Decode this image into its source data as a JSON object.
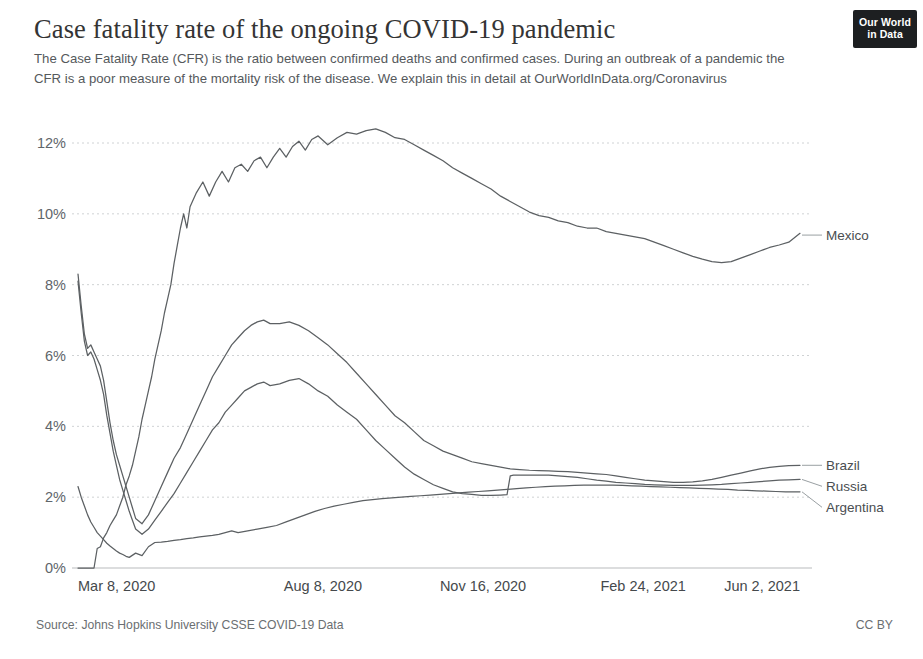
{
  "header": {
    "title": "Case fatality rate of the ongoing COVID-19 pandemic",
    "subtitle": "The Case Fatality Rate (CFR) is the ratio between confirmed deaths and confirmed cases. During an outbreak of a pandemic the CFR is a poor measure of the mortality risk of the disease. We explain this in detail at OurWorldInData.org/Coronavirus",
    "logo_line1": "Our World",
    "logo_line2": "in Data"
  },
  "footer": {
    "source": "Source: Johns Hopkins University CSSE COVID-19 Data",
    "license": "CC BY"
  },
  "colors": {
    "line": "#5c6063",
    "grid": "#cfd2d4",
    "text": "#45494c",
    "logo_bg": "#1d1f21"
  },
  "chart_data": {
    "type": "line",
    "title": "Case fatality rate of the ongoing COVID-19 pandemic",
    "subtitle": "The Case Fatality Rate (CFR) is the ratio between confirmed deaths and confirmed cases. During an outbreak of a pandemic the CFR is a poor measure of the mortality risk of the disease. We explain this in detail at OurWorldInData.org/Coronavirus",
    "xlabel": "",
    "ylabel": "",
    "ylim": [
      0,
      12.8
    ],
    "yticks": [
      0,
      2,
      4,
      6,
      8,
      10,
      12
    ],
    "ytick_labels": [
      "0%",
      "2%",
      "4%",
      "6%",
      "8%",
      "10%",
      "12%"
    ],
    "xticks": [
      0,
      153,
      253,
      353,
      451
    ],
    "xtick_labels": [
      "Mar 8, 2020",
      "Aug 8, 2020",
      "Nov 16, 2020",
      "Feb 24, 2021",
      "Jun 2, 2021"
    ],
    "x_start": "Mar 8, 2020",
    "x_end": "Jun 2, 2021",
    "grid": true,
    "legend_position": "right-inline",
    "unit": "%",
    "series": [
      {
        "name": "Mexico",
        "end_value": 9.4,
        "peak_value": 12.4,
        "min_value": 0.6,
        "x": [
          0,
          2,
          4,
          6,
          8,
          10,
          12,
          14,
          16,
          18,
          20,
          22,
          24,
          26,
          28,
          30,
          32,
          34,
          36,
          38,
          40,
          42,
          44,
          46,
          48,
          50,
          52,
          54,
          56,
          58,
          60,
          62,
          64,
          66,
          68,
          70,
          74,
          78,
          82,
          86,
          90,
          94,
          98,
          102,
          106,
          110,
          114,
          118,
          122,
          126,
          130,
          134,
          138,
          142,
          146,
          150,
          156,
          162,
          168,
          174,
          180,
          186,
          192,
          198,
          204,
          210,
          216,
          222,
          228,
          234,
          240,
          246,
          252,
          258,
          264,
          270,
          276,
          282,
          288,
          294,
          300,
          306,
          312,
          318,
          324,
          330,
          336,
          342,
          348,
          354,
          360,
          366,
          372,
          378,
          384,
          390,
          396,
          402,
          408,
          414,
          420,
          426,
          432,
          438,
          444,
          451
        ],
        "y": [
          0.0,
          0.0,
          0.0,
          0.0,
          0.0,
          0.0,
          0.55,
          0.6,
          0.85,
          1.0,
          1.2,
          1.35,
          1.5,
          1.75,
          2.0,
          2.35,
          2.6,
          2.9,
          3.3,
          3.7,
          4.2,
          4.6,
          5.0,
          5.4,
          5.9,
          6.3,
          6.7,
          7.2,
          7.6,
          8.0,
          8.6,
          9.1,
          9.6,
          10.0,
          9.6,
          10.2,
          10.6,
          10.9,
          10.5,
          10.9,
          11.2,
          10.9,
          11.3,
          11.4,
          11.2,
          11.5,
          11.6,
          11.3,
          11.6,
          11.85,
          11.6,
          11.9,
          12.05,
          11.8,
          12.1,
          12.2,
          11.95,
          12.15,
          12.3,
          12.25,
          12.35,
          12.4,
          12.3,
          12.15,
          12.1,
          11.95,
          11.8,
          11.65,
          11.5,
          11.3,
          11.15,
          11.0,
          10.85,
          10.7,
          10.5,
          10.35,
          10.2,
          10.05,
          9.95,
          9.9,
          9.8,
          9.75,
          9.65,
          9.6,
          9.6,
          9.5,
          9.45,
          9.4,
          9.35,
          9.3,
          9.2,
          9.1,
          9.0,
          8.9,
          8.8,
          8.72,
          8.65,
          8.62,
          8.65,
          8.75,
          8.85,
          8.95,
          9.05,
          9.12,
          9.2,
          9.45
        ]
      },
      {
        "name": "Brazil",
        "end_value": 2.9,
        "peak_value": 7.0,
        "min_value": 0.4,
        "x": [
          0,
          2,
          4,
          6,
          8,
          10,
          12,
          14,
          16,
          18,
          20,
          22,
          24,
          26,
          28,
          30,
          32,
          34,
          36,
          40,
          44,
          48,
          52,
          56,
          60,
          64,
          68,
          72,
          76,
          80,
          84,
          88,
          92,
          96,
          100,
          104,
          108,
          112,
          116,
          120,
          126,
          132,
          138,
          144,
          150,
          156,
          162,
          168,
          174,
          180,
          186,
          192,
          198,
          204,
          210,
          216,
          222,
          228,
          234,
          240,
          246,
          252,
          258,
          264,
          270,
          276,
          282,
          288,
          294,
          300,
          306,
          312,
          318,
          324,
          330,
          336,
          342,
          348,
          354,
          360,
          366,
          372,
          378,
          384,
          390,
          396,
          402,
          408,
          414,
          420,
          426,
          432,
          438,
          444,
          451
        ],
        "y": [
          8.3,
          7.4,
          6.6,
          6.2,
          6.3,
          6.1,
          5.9,
          5.7,
          5.3,
          4.7,
          4.1,
          3.6,
          3.2,
          2.9,
          2.6,
          2.3,
          2.0,
          1.7,
          1.4,
          1.25,
          1.5,
          1.9,
          2.3,
          2.7,
          3.1,
          3.4,
          3.8,
          4.2,
          4.6,
          5.0,
          5.4,
          5.7,
          6.0,
          6.3,
          6.5,
          6.7,
          6.85,
          6.95,
          7.0,
          6.9,
          6.9,
          6.95,
          6.85,
          6.7,
          6.5,
          6.3,
          6.05,
          5.8,
          5.5,
          5.2,
          4.9,
          4.6,
          4.3,
          4.1,
          3.85,
          3.6,
          3.45,
          3.3,
          3.2,
          3.1,
          3.0,
          2.95,
          2.9,
          2.85,
          2.8,
          2.78,
          2.76,
          2.75,
          2.74,
          2.73,
          2.72,
          2.7,
          2.68,
          2.66,
          2.64,
          2.6,
          2.56,
          2.52,
          2.48,
          2.46,
          2.44,
          2.42,
          2.42,
          2.43,
          2.46,
          2.5,
          2.56,
          2.62,
          2.68,
          2.74,
          2.8,
          2.84,
          2.87,
          2.89,
          2.9
        ]
      },
      {
        "name": "Russia",
        "end_value": 2.5,
        "peak_value": 5.35,
        "min_value": 0.4,
        "x": [
          0,
          2,
          4,
          6,
          8,
          10,
          12,
          14,
          16,
          18,
          20,
          22,
          24,
          26,
          28,
          30,
          32,
          34,
          36,
          40,
          44,
          48,
          52,
          56,
          60,
          64,
          68,
          72,
          76,
          80,
          84,
          88,
          92,
          96,
          100,
          104,
          108,
          112,
          116,
          120,
          126,
          132,
          138,
          144,
          150,
          156,
          162,
          168,
          174,
          180,
          186,
          192,
          198,
          204,
          210,
          216,
          222,
          228,
          234,
          240,
          246,
          252,
          258,
          264,
          268,
          270,
          272,
          276,
          282,
          288,
          294,
          300,
          306,
          312,
          318,
          324,
          330,
          336,
          342,
          348,
          354,
          360,
          366,
          372,
          378,
          384,
          390,
          396,
          402,
          408,
          414,
          420,
          426,
          432,
          438,
          444,
          451
        ],
        "y": [
          8.1,
          7.2,
          6.4,
          6.0,
          6.1,
          5.9,
          5.6,
          5.3,
          4.9,
          4.3,
          3.8,
          3.3,
          2.9,
          2.5,
          2.2,
          1.9,
          1.6,
          1.35,
          1.1,
          0.95,
          1.1,
          1.35,
          1.6,
          1.85,
          2.1,
          2.4,
          2.7,
          3.0,
          3.3,
          3.6,
          3.9,
          4.1,
          4.4,
          4.6,
          4.8,
          5.0,
          5.1,
          5.2,
          5.25,
          5.15,
          5.2,
          5.3,
          5.35,
          5.2,
          5.0,
          4.85,
          4.6,
          4.4,
          4.2,
          3.9,
          3.6,
          3.35,
          3.1,
          2.85,
          2.65,
          2.5,
          2.35,
          2.25,
          2.15,
          2.1,
          2.08,
          2.05,
          2.05,
          2.06,
          2.07,
          2.6,
          2.62,
          2.62,
          2.62,
          2.62,
          2.62,
          2.6,
          2.58,
          2.56,
          2.52,
          2.48,
          2.45,
          2.42,
          2.4,
          2.38,
          2.36,
          2.35,
          2.34,
          2.33,
          2.33,
          2.33,
          2.34,
          2.35,
          2.36,
          2.38,
          2.4,
          2.42,
          2.44,
          2.46,
          2.48,
          2.49,
          2.5
        ]
      },
      {
        "name": "Argentina",
        "end_value": 2.15,
        "peak_value": 2.75,
        "min_value": 0.3,
        "x": [
          0,
          2,
          4,
          6,
          8,
          10,
          12,
          14,
          16,
          18,
          20,
          22,
          24,
          26,
          28,
          30,
          32,
          36,
          40,
          44,
          48,
          52,
          56,
          60,
          64,
          68,
          72,
          76,
          80,
          84,
          88,
          92,
          96,
          100,
          106,
          112,
          118,
          124,
          130,
          136,
          142,
          148,
          154,
          160,
          166,
          172,
          178,
          184,
          190,
          196,
          202,
          208,
          214,
          220,
          226,
          232,
          238,
          244,
          250,
          256,
          262,
          268,
          274,
          280,
          286,
          292,
          298,
          304,
          310,
          316,
          322,
          328,
          334,
          340,
          346,
          352,
          358,
          364,
          370,
          376,
          382,
          388,
          394,
          400,
          406,
          412,
          418,
          424,
          430,
          436,
          442,
          451
        ],
        "y": [
          2.3,
          2.0,
          1.75,
          1.5,
          1.3,
          1.15,
          1.0,
          0.9,
          0.8,
          0.7,
          0.62,
          0.55,
          0.48,
          0.42,
          0.38,
          0.33,
          0.3,
          0.42,
          0.35,
          0.6,
          0.72,
          0.73,
          0.75,
          0.78,
          0.8,
          0.83,
          0.85,
          0.88,
          0.9,
          0.92,
          0.95,
          1.0,
          1.05,
          1.0,
          1.05,
          1.1,
          1.15,
          1.2,
          1.3,
          1.4,
          1.5,
          1.6,
          1.68,
          1.75,
          1.8,
          1.85,
          1.9,
          1.93,
          1.96,
          1.98,
          2.0,
          2.02,
          2.04,
          2.06,
          2.08,
          2.1,
          2.12,
          2.14,
          2.16,
          2.18,
          2.2,
          2.22,
          2.24,
          2.26,
          2.28,
          2.3,
          2.31,
          2.32,
          2.33,
          2.34,
          2.34,
          2.34,
          2.34,
          2.33,
          2.32,
          2.31,
          2.3,
          2.29,
          2.28,
          2.27,
          2.26,
          2.25,
          2.24,
          2.23,
          2.22,
          2.2,
          2.19,
          2.18,
          2.17,
          2.16,
          2.15,
          2.15
        ]
      }
    ]
  }
}
